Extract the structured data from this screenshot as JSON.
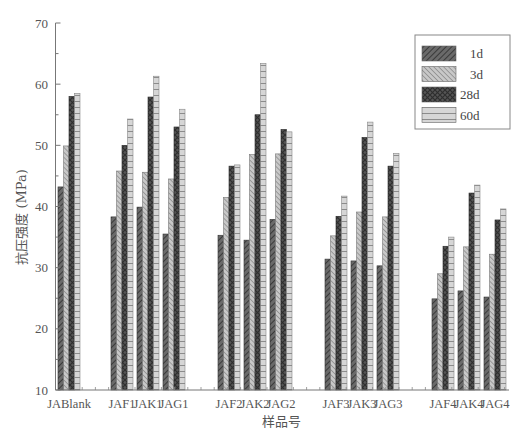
{
  "chart_data": {
    "type": "bar",
    "title": "",
    "xlabel": "样品号",
    "ylabel": "抗压强度 (MPa)",
    "ylim": [
      10,
      70
    ],
    "yticks": [
      10,
      20,
      30,
      40,
      50,
      60,
      70
    ],
    "grid": false,
    "legend_position": "upper right",
    "categories": [
      "JABlank",
      "JAF1",
      "JAK1",
      "JAG1",
      "JAF2",
      "JAK2",
      "JAG2",
      "JAF3",
      "JAK3",
      "JAG3",
      "JAF4",
      "JAK4",
      "JAG4"
    ],
    "category_groups": [
      [
        "JABlank"
      ],
      [
        "JAF1",
        "JAK1",
        "JAG1"
      ],
      [
        "JAF2",
        "JAK2",
        "JAG2"
      ],
      [
        "JAF3",
        "JAK3",
        "JAG3"
      ],
      [
        "JAF4",
        "JAK4",
        "JAG4"
      ]
    ],
    "series": [
      {
        "name": "1d",
        "pattern": "diagonal-dark",
        "values": [
          43.2,
          38.3,
          39.9,
          35.5,
          35.3,
          34.5,
          37.9,
          31.4,
          31.1,
          30.3,
          24.9,
          26.2,
          25.2
        ]
      },
      {
        "name": "3d",
        "pattern": "diagonal-light",
        "values": [
          49.9,
          45.8,
          45.6,
          44.5,
          41.5,
          48.5,
          48.6,
          35.2,
          39.1,
          38.3,
          29.0,
          33.4,
          32.2
        ]
      },
      {
        "name": "28d",
        "pattern": "crosshatch-dark",
        "values": [
          58.0,
          50.0,
          57.9,
          53.0,
          46.6,
          55.0,
          52.6,
          38.4,
          51.3,
          46.6,
          33.5,
          42.2,
          37.8
        ]
      },
      {
        "name": "60d",
        "pattern": "grid-light",
        "values": [
          58.5,
          54.3,
          61.3,
          55.9,
          46.8,
          63.4,
          52.2,
          41.7,
          53.8,
          48.7,
          35.0,
          43.5,
          39.6
        ]
      }
    ]
  },
  "colors": {
    "axis": "#777777",
    "s1d": "#5a5a5a",
    "s3d": "#b4b4b4",
    "s28d": "#4d4d4d",
    "s60d": "#d2d2d2"
  }
}
